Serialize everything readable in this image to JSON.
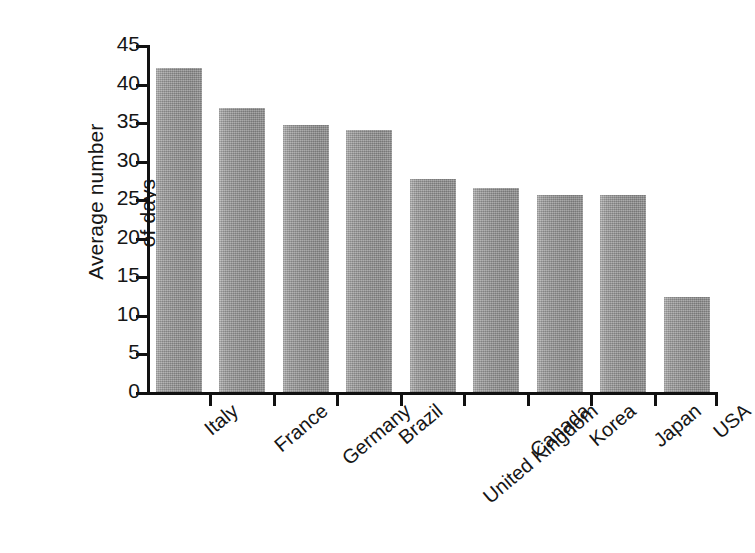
{
  "chart_data": {
    "type": "bar",
    "title": "",
    "subtitle": "",
    "xlabel": "",
    "ylabel": "Average number of days",
    "ylabel_lines": [
      "Average number",
      "of days"
    ],
    "categories": [
      "Italy",
      "France",
      "Germany",
      "Brazil",
      "United Kingdom",
      "Canada",
      "Korea",
      "Japan",
      "USA"
    ],
    "values": [
      42.0,
      36.8,
      34.6,
      34.0,
      27.6,
      26.4,
      25.5,
      25.5,
      12.3
    ],
    "series": [
      {
        "name": "Average number of days",
        "values": [
          42.0,
          36.8,
          34.6,
          34.0,
          27.6,
          26.4,
          25.5,
          25.5,
          12.3
        ]
      }
    ],
    "ylim": [
      0,
      45
    ],
    "yticks": [
      0,
      5,
      10,
      15,
      20,
      25,
      30,
      35,
      40,
      45
    ],
    "ytick_labels": [
      "0",
      "5",
      "10",
      "15",
      "20",
      "25",
      "30",
      "35",
      "40",
      "45"
    ],
    "grid": false,
    "legend": false,
    "legend_position": "none",
    "bar_color": "#9a9a9a",
    "axis_color": "#111111",
    "text_color": "#161616",
    "background_color": "#ffffff",
    "xlabel_rotation_deg": -40
  }
}
